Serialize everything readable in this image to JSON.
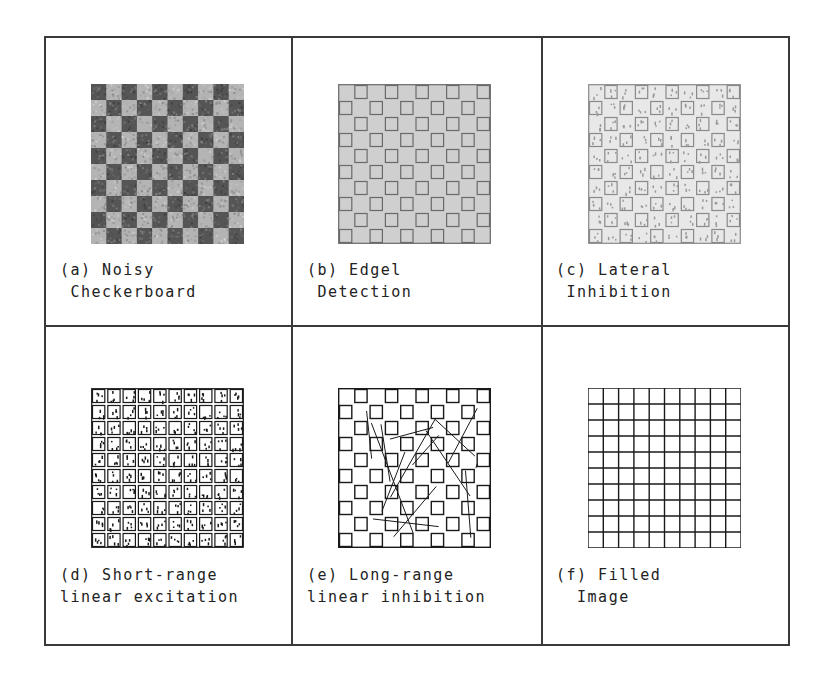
{
  "figure": {
    "grid_size": 10,
    "colors": {
      "frame": "#3a3a3a",
      "ink": "#1a1a1a",
      "dark_cell": "#555555",
      "light_cell": "#b4b4b4",
      "edge_bg": "#cfcfcf",
      "lateral_bg": "#e8e8e8"
    },
    "panels": [
      {
        "id": "a",
        "style": "noisy",
        "line1": "(a) Noisy",
        "line2": " Checkerboard"
      },
      {
        "id": "b",
        "style": "edgel",
        "line1": "(b) Edgel",
        "line2": " Detection"
      },
      {
        "id": "c",
        "style": "lateral",
        "line1": "(c) Lateral",
        "line2": " Inhibition"
      },
      {
        "id": "d",
        "style": "short",
        "line1": "(d) Short-range",
        "line2": "linear excitation"
      },
      {
        "id": "e",
        "style": "long",
        "line1": "(e) Long-range",
        "line2": "linear inhibition"
      },
      {
        "id": "f",
        "style": "filled",
        "line1": "(f) Filled",
        "line2": "  Image"
      }
    ]
  }
}
